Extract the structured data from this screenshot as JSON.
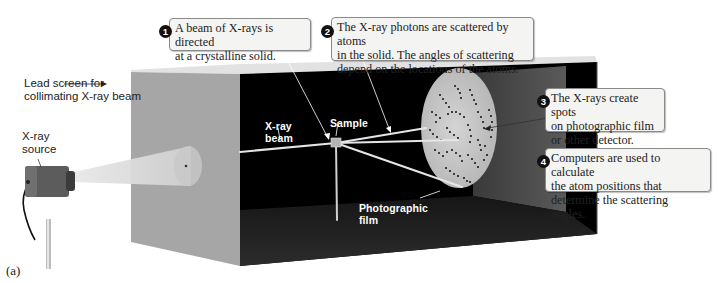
{
  "figure": {
    "caption": "(a)",
    "colors": {
      "box_face": "#a8a8a8",
      "box_top": "#dcdcdc",
      "interior": "#000000",
      "interior_floor": "#1a1a1a",
      "film": "#c9c9c9",
      "beam": "#e6e6e6",
      "callout_bg": "#f4f4f2",
      "callout_border": "#8a8a8a",
      "badge": "#111111"
    }
  },
  "labels": {
    "lead_screen": [
      "Lead screen for",
      "collimating X-ray beam"
    ],
    "xray_source": [
      "X-ray",
      "source"
    ],
    "xray_beam": [
      "X-ray",
      "beam"
    ],
    "sample": "Sample",
    "photographic_film": [
      "Photographic",
      "film"
    ]
  },
  "callouts": [
    {
      "number": "1",
      "lines": [
        "A beam of X-rays is directed",
        "at a crystalline solid."
      ]
    },
    {
      "number": "2",
      "lines": [
        "The X-ray photons are scattered by atoms",
        "in the solid. The angles of scattering",
        "depend on the locations of the atoms."
      ]
    },
    {
      "number": "3",
      "lines": [
        "The X-rays create spots",
        "on photographic film",
        "or other detector."
      ]
    },
    {
      "number": "4",
      "lines": [
        "Computers are used to calculate",
        "the atom positions that",
        "determine the scattering angles."
      ]
    }
  ]
}
